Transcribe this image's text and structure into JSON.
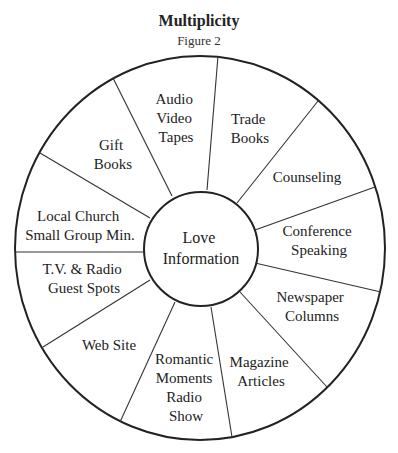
{
  "header": {
    "title": "Multiplicity",
    "subtitle": "Figure 2"
  },
  "center": {
    "lines": [
      "Love",
      "Information"
    ]
  },
  "segments": [
    {
      "id": "audio-video-tapes",
      "lines": [
        "Audio",
        "Video",
        "Tapes"
      ]
    },
    {
      "id": "trade-books",
      "lines": [
        "Trade",
        "Books"
      ]
    },
    {
      "id": "counseling",
      "lines": [
        "Counseling"
      ]
    },
    {
      "id": "conference-speaking",
      "lines": [
        "Conference",
        "Speaking"
      ]
    },
    {
      "id": "newspaper-columns",
      "lines": [
        "Newspaper",
        "Columns"
      ]
    },
    {
      "id": "magazine-articles",
      "lines": [
        "Magazine",
        "Articles"
      ]
    },
    {
      "id": "romantic-moments-radio-show",
      "lines": [
        "Romantic",
        "Moments",
        "Radio",
        "Show"
      ]
    },
    {
      "id": "web-site",
      "lines": [
        "Web Site"
      ]
    },
    {
      "id": "tv-radio-guest-spots",
      "lines": [
        "T.V. & Radio",
        "Guest Spots"
      ]
    },
    {
      "id": "local-church-small-group",
      "lines": [
        "Local Church",
        "Small Group Min."
      ]
    },
    {
      "id": "gift-books",
      "lines": [
        "Gift",
        "Books"
      ]
    }
  ],
  "colors": {
    "stroke": "#222222",
    "background": "#ffffff",
    "text": "#222222"
  }
}
